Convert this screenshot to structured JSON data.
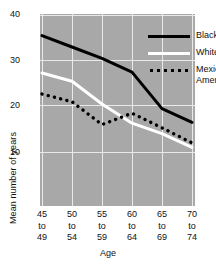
{
  "chart_data": {
    "type": "line",
    "title": "",
    "xlabel": "Age",
    "ylabel": "Mean number of years",
    "categories": [
      "45\nto\n49",
      "50\nto\n54",
      "55\nto\n59",
      "60\nto\n64",
      "65\nto\n69",
      "70\nto\n74"
    ],
    "category_labels": [
      {
        "start": "45",
        "to": "to",
        "end": "49"
      },
      {
        "start": "50",
        "to": "to",
        "end": "54"
      },
      {
        "start": "55",
        "to": "to",
        "end": "59"
      },
      {
        "start": "60",
        "to": "to",
        "end": "64"
      },
      {
        "start": "65",
        "to": "to",
        "end": "69"
      },
      {
        "start": "70",
        "to": "to",
        "end": "74"
      }
    ],
    "ylim": [
      6,
      41
    ],
    "yticks": [
      10,
      20,
      30,
      40
    ],
    "ytick_labels": [
      "10",
      "20",
      "30",
      "40"
    ],
    "grid": true,
    "legend_position": "top-right",
    "series": [
      {
        "name": "Blacks",
        "style": "solid",
        "color": "#000000",
        "values": [
          35.5,
          33.0,
          30.5,
          27.5,
          19.5,
          16.5
        ]
      },
      {
        "name": "Whites",
        "style": "solid",
        "color": "#ffffff",
        "values": [
          27.3,
          25.5,
          20.5,
          16.3,
          14.0,
          11.0
        ]
      },
      {
        "name": "Mexican\nAmericans",
        "style": "dotted",
        "color": "#000000",
        "values": [
          22.7,
          21.0,
          16.0,
          18.5,
          15.3,
          12.0
        ]
      }
    ]
  },
  "legend": {
    "items": [
      {
        "label": "Blacks",
        "icon": "solid-black-line-swatch"
      },
      {
        "label": "Whites",
        "icon": "solid-white-line-swatch"
      },
      {
        "label": "Mexican\nAmericans",
        "icon": "dotted-black-line-swatch"
      }
    ]
  },
  "colors": {
    "plot_background": "#a8a8a8",
    "gridline": "#e9e9e9",
    "page_background": "#ffffff",
    "text": "#111111",
    "blacks_series": "#000000",
    "whites_series": "#ffffff",
    "mexican_americans_series": "#000000"
  }
}
